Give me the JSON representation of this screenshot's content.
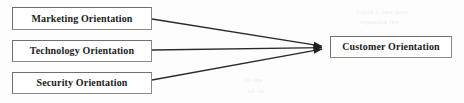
{
  "diagram": {
    "type": "conceptual-model",
    "nodes": [
      {
        "id": "marketing",
        "label": "Marketing Orientation"
      },
      {
        "id": "technology",
        "label": "Technology Orientation"
      },
      {
        "id": "security",
        "label": "Security Orientation"
      },
      {
        "id": "customer",
        "label": "Customer Orientation"
      }
    ],
    "edges": [
      {
        "from": "marketing",
        "to": "customer",
        "arrow": "single"
      },
      {
        "from": "technology",
        "to": "customer",
        "arrow": "single"
      },
      {
        "from": "security",
        "to": "customer",
        "arrow": "single"
      }
    ],
    "colors": {
      "background": "#fdfdfd",
      "node_fill": "#ffffff",
      "node_border": "#6f6f6f",
      "edge": "#2a2a2a",
      "text": "#1b1b1b",
      "bleed_through": "#ebebeb"
    }
  },
  "background_artifacts": {
    "note": "faint illegible bleed-through text from reverse page",
    "fragments": [
      "Table 1 and note",
      "equation  list",
      "  to   the",
      "  of   an"
    ]
  }
}
